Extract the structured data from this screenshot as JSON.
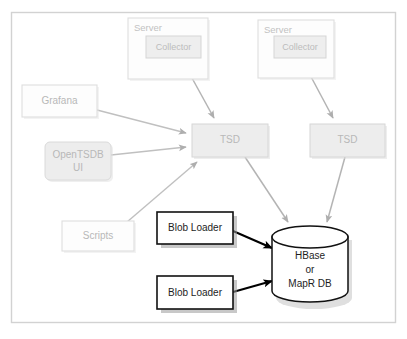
{
  "diagram": {
    "frame": {
      "border_color": "#d6d6d6",
      "background": "#ffffff"
    },
    "colors": {
      "faint_stroke": "#dcdcdc",
      "faint_fill": "#fbfbfb",
      "gray_fill": "#ececec",
      "gray_stroke": "#d2d2d2",
      "gray_text": "#b8b8b8",
      "dark_stroke": "#111111",
      "dark_text": "#1d1d1d",
      "arrow_gray": "#b0b0b0",
      "arrow_black": "#000000",
      "shadow": "#d9d9d9"
    },
    "nodes": [
      {
        "id": "server-1",
        "name": "server-box-1",
        "label": "Server",
        "style": "faint",
        "x": 128,
        "y": 18,
        "w": 80,
        "h": 61
      },
      {
        "id": "collector-1",
        "name": "collector-box-1",
        "label": "Collector",
        "style": "gray",
        "x": 146,
        "y": 36,
        "w": 55,
        "h": 22
      },
      {
        "id": "server-2",
        "name": "server-box-2",
        "label": "Server",
        "style": "faint",
        "x": 258,
        "y": 20,
        "w": 76,
        "h": 58
      },
      {
        "id": "collector-2",
        "name": "collector-box-2",
        "label": "Collector",
        "style": "gray",
        "x": 274,
        "y": 36,
        "w": 52,
        "h": 22
      },
      {
        "id": "grafana",
        "name": "grafana-box",
        "label": "Grafana",
        "style": "faint",
        "x": 22,
        "y": 85,
        "w": 75,
        "h": 32
      },
      {
        "id": "opentsdb-ui",
        "name": "opentsdb-ui-box",
        "label": "OpenTSDB\nUI",
        "label_lines": [
          "OpenTSDB",
          "UI"
        ],
        "style": "gray-rounded",
        "x": 45,
        "y": 142,
        "w": 66,
        "h": 38
      },
      {
        "id": "scripts",
        "name": "scripts-box",
        "label": "Scripts",
        "style": "faint",
        "x": 62,
        "y": 221,
        "w": 72,
        "h": 30
      },
      {
        "id": "tsd-1",
        "name": "tsd-box-1",
        "label": "TSD",
        "style": "gray",
        "x": 192,
        "y": 124,
        "w": 76,
        "h": 33
      },
      {
        "id": "tsd-2",
        "name": "tsd-box-2",
        "label": "TSD",
        "style": "gray",
        "x": 310,
        "y": 124,
        "w": 75,
        "h": 33
      },
      {
        "id": "blob-loader-1",
        "name": "blob-loader-box-1",
        "label": "Blob Loader",
        "style": "dark",
        "x": 157,
        "y": 212,
        "w": 76,
        "h": 32
      },
      {
        "id": "blob-loader-2",
        "name": "blob-loader-box-2",
        "label": "Blob Loader",
        "style": "dark",
        "x": 157,
        "y": 276,
        "w": 76,
        "h": 33
      },
      {
        "id": "database",
        "name": "database-cylinder",
        "label": "HBase\nor\nMapR DB",
        "label_lines": [
          "HBase",
          "or",
          "MapR DB"
        ],
        "style": "cylinder",
        "x": 272,
        "y": 228,
        "w": 76,
        "h": 74
      }
    ],
    "edges": [
      {
        "name": "edge-collector1-to-tsd1",
        "from": "collector-1",
        "to": "tsd-1",
        "color": "gray"
      },
      {
        "name": "edge-collector2-to-tsd2",
        "from": "collector-2",
        "to": "tsd-2",
        "color": "gray"
      },
      {
        "name": "edge-grafana-to-tsd1",
        "from": "grafana",
        "to": "tsd-1",
        "color": "gray"
      },
      {
        "name": "edge-opentsdbui-to-tsd1",
        "from": "opentsdb-ui",
        "to": "tsd-1",
        "color": "gray"
      },
      {
        "name": "edge-scripts-to-tsd1",
        "from": "scripts",
        "to": "tsd-1",
        "color": "gray"
      },
      {
        "name": "edge-tsd1-to-database",
        "from": "tsd-1",
        "to": "database",
        "color": "gray"
      },
      {
        "name": "edge-tsd2-to-database",
        "from": "tsd-2",
        "to": "database",
        "color": "gray"
      },
      {
        "name": "edge-blobloader1-to-database",
        "from": "blob-loader-1",
        "to": "database",
        "color": "black"
      },
      {
        "name": "edge-blobloader2-to-database",
        "from": "blob-loader-2",
        "to": "database",
        "color": "black"
      }
    ]
  }
}
